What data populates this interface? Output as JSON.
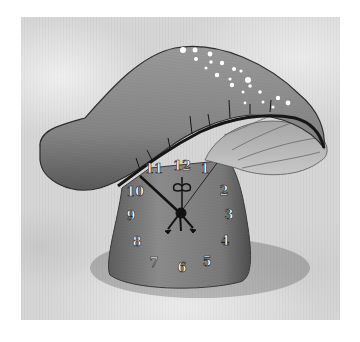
{
  "image": {
    "subject": "mushroom-shaped wall clock",
    "style": "grayscale product photo on textured light background",
    "colors": {
      "background": "#ffffff",
      "backdrop": "#d6d6d6",
      "cap": "#8a8a8a",
      "cap_shadow": "#3a3a3a",
      "stem": "#7d7d7d",
      "gills": "#b8b8b8",
      "numerals": "#f4f4f4",
      "hands": "#111111",
      "dots": "#ffffff"
    }
  },
  "clock": {
    "numerals": [
      "12",
      "1",
      "2",
      "3",
      "4",
      "5",
      "6",
      "7",
      "8",
      "9",
      "10",
      "11"
    ],
    "center": {
      "x": 180,
      "y": 213
    }
  }
}
